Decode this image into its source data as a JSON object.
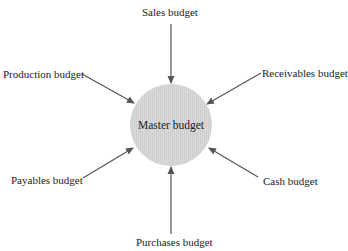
{
  "diagram": {
    "center": {
      "label": "Master budget",
      "fill_color": "#d6d6d6",
      "cx": 171,
      "cy": 125,
      "r": 41
    },
    "arrow_color": "#555555",
    "nodes": [
      {
        "id": "sales",
        "label": "Sales budget"
      },
      {
        "id": "receivables",
        "label": "Receivables budget"
      },
      {
        "id": "cash",
        "label": "Cash budget"
      },
      {
        "id": "purchases",
        "label": "Purchases budget"
      },
      {
        "id": "payables",
        "label": "Payables budget"
      },
      {
        "id": "production",
        "label": "Production budget"
      }
    ],
    "edges": [
      {
        "from": "sales",
        "to": "master"
      },
      {
        "from": "receivables",
        "to": "master"
      },
      {
        "from": "cash",
        "to": "master"
      },
      {
        "from": "purchases",
        "to": "master"
      },
      {
        "from": "payables",
        "to": "master"
      },
      {
        "from": "production",
        "to": "master"
      }
    ]
  }
}
